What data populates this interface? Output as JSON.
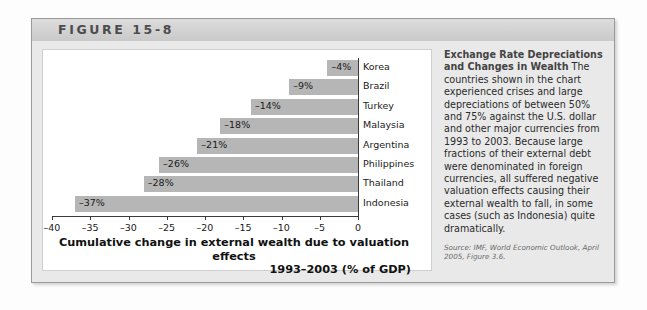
{
  "figure": {
    "label": "FIGURE 15-8"
  },
  "chart_data": {
    "type": "bar",
    "orientation": "horizontal",
    "title": "",
    "xlabel_line1": "Cumulative change in external wealth due to valuation effects",
    "xlabel_line2": "1993–2003 (% of GDP)",
    "ylabel": "",
    "xlim": [
      -40,
      0
    ],
    "xticks": [
      -40,
      -35,
      -30,
      -25,
      -20,
      -15,
      -10,
      -5,
      0
    ],
    "xticklabels": [
      "–40",
      "–35",
      "–30",
      "–25",
      "–20",
      "–15",
      "–10",
      "–5",
      "0"
    ],
    "grid": false,
    "legend": "none",
    "bar_color": "#b6b6b6",
    "categories": [
      "Korea",
      "Brazil",
      "Turkey",
      "Malaysia",
      "Argentina",
      "Philippines",
      "Thailand",
      "Indonesia"
    ],
    "values": [
      -4,
      -9,
      -14,
      -18,
      -21,
      -26,
      -28,
      -37
    ],
    "value_labels": [
      "–4%",
      "–9%",
      "–14%",
      "–18%",
      "–21%",
      "–26%",
      "–28%",
      "–37%"
    ]
  },
  "caption": {
    "heading": "Exchange Rate Depreciations and Changes in Wealth",
    "body": " The countries shown in the chart experienced crises and large depreciations of between 50% and 75% against the U.S. dollar and other major currencies from 1993 to 2003. Because large fractions of their external debt were denominated in foreign currencies, all suffered negative valuation effects causing their external wealth to fall, in some cases (such as Indonesia) quite dramatically.",
    "source": "Source: IMF, World Economic Outlook, April 2005, Figure 3.6."
  }
}
